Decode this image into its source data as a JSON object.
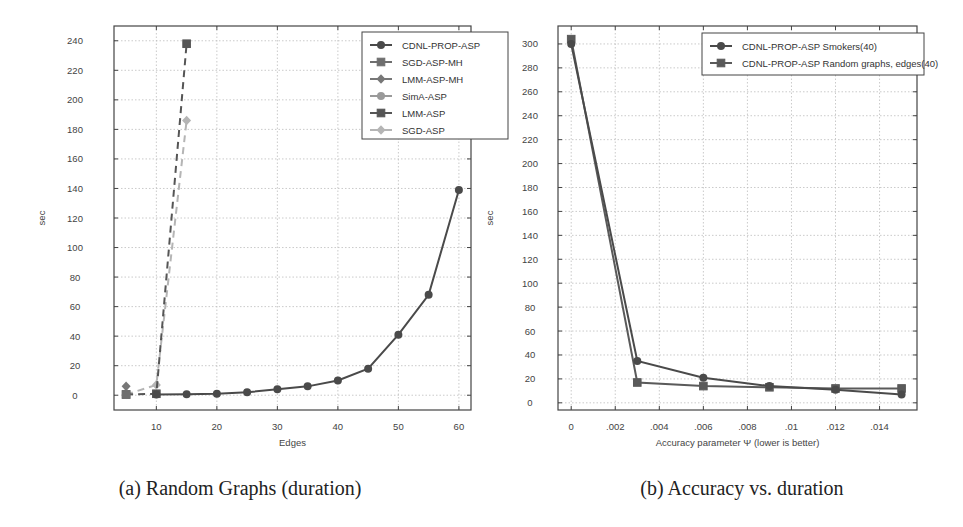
{
  "chart_data": [
    {
      "type": "line",
      "title": "",
      "caption": "(a) Random Graphs (duration)",
      "xlabel": "Edges",
      "ylabel": "sec",
      "xlim": [
        3,
        62
      ],
      "ylim": [
        -10,
        250
      ],
      "xticks": [
        10,
        20,
        30,
        40,
        50,
        60
      ],
      "yticks": [
        0,
        20,
        40,
        60,
        80,
        100,
        120,
        140,
        160,
        180,
        200,
        220,
        240
      ],
      "grid": true,
      "legend_position": "top-right",
      "series": [
        {
          "name": "CDNL-PROP-ASP",
          "color": "#4a4a4a",
          "marker": "circle",
          "dash": "solid",
          "x": [
            10,
            15,
            20,
            25,
            30,
            35,
            40,
            45,
            50,
            55,
            60
          ],
          "y": [
            0.5,
            0.7,
            1,
            2,
            4,
            6,
            10,
            18,
            41,
            68,
            139
          ]
        },
        {
          "name": "SGD-ASP-MH",
          "color": "#6e6e6e",
          "marker": "square",
          "dash": "solid",
          "x": [
            5
          ],
          "y": [
            0.5
          ]
        },
        {
          "name": "LMM-ASP-MH",
          "color": "#777777",
          "marker": "diamond",
          "dash": "solid",
          "x": [
            5
          ],
          "y": [
            6
          ]
        },
        {
          "name": "SimA-ASP",
          "color": "#9a9a9a",
          "marker": "circle",
          "dash": "solid",
          "x": [
            5
          ],
          "y": [
            0.5
          ]
        },
        {
          "name": "LMM-ASP",
          "color": "#555555",
          "marker": "square",
          "dash": "dashed",
          "x": [
            5,
            10,
            15
          ],
          "y": [
            0.5,
            1,
            238
          ]
        },
        {
          "name": "SGD-ASP",
          "color": "#b5b5b5",
          "marker": "diamond",
          "dash": "dashed",
          "x": [
            5,
            10,
            15
          ],
          "y": [
            0.5,
            7,
            186
          ]
        }
      ]
    },
    {
      "type": "line",
      "title": "",
      "caption": "(b) Accuracy vs. duration",
      "xlabel": "Accuracy parameter Ψ (lower is better)",
      "ylabel": "sec",
      "xlim": [
        -0.0006,
        0.0157
      ],
      "ylim": [
        -6,
        315
      ],
      "xticks": [
        0,
        0.002,
        0.004,
        0.006,
        0.008,
        0.01,
        0.012,
        0.014
      ],
      "xtick_labels": [
        "0",
        ".002",
        ".004",
        ".006",
        ".008",
        ".01",
        ".012",
        ".014"
      ],
      "yticks": [
        0,
        20,
        40,
        60,
        80,
        100,
        120,
        140,
        160,
        180,
        200,
        220,
        240,
        260,
        280,
        300
      ],
      "grid": true,
      "legend_position": "top-right",
      "series": [
        {
          "name": "CDNL-PROP-ASP Smokers(40)",
          "color": "#4a4a4a",
          "marker": "circle",
          "dash": "solid",
          "x": [
            0,
            0.003,
            0.006,
            0.009,
            0.012,
            0.015
          ],
          "y": [
            300,
            35,
            21,
            14,
            11,
            7
          ]
        },
        {
          "name": "CDNL-PROP-ASP Random graphs, edges(40)",
          "color": "#5a5a5a",
          "marker": "square",
          "dash": "solid",
          "x": [
            0,
            0.003,
            0.006,
            0.009,
            0.012,
            0.015
          ],
          "y": [
            304,
            17,
            14,
            13,
            12,
            12
          ]
        }
      ]
    }
  ]
}
